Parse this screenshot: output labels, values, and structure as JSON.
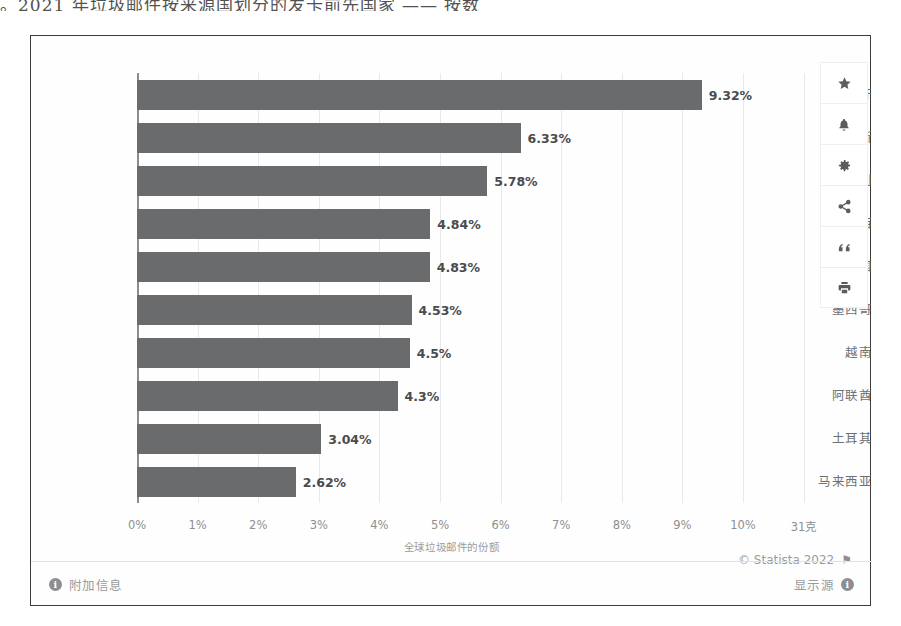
{
  "scan_text": "。2021 年垃圾邮件按来源国划分的发卡前先国家 —— 按数",
  "chart_data": {
    "type": "bar",
    "orientation": "horizontal",
    "title": "",
    "xlabel": "全球垃圾邮件的份额",
    "ylabel": "",
    "grid": true,
    "legend": false,
    "xlim": [
      0,
      10.5
    ],
    "categories": [
      "西班牙",
      "俄罗斯",
      "意大利",
      "巴西",
      "德国",
      "墨西哥",
      "越南",
      "阿联酋",
      "土耳其",
      "马来西亚"
    ],
    "values": [
      9.32,
      6.33,
      5.78,
      4.84,
      4.83,
      4.53,
      4.5,
      4.3,
      3.04,
      2.62
    ],
    "value_labels": [
      "9.32%",
      "6.33%",
      "5.78%",
      "4.84%",
      "4.83%",
      "4.53%",
      "4.5%",
      "4.3%",
      "3.04%",
      "2.62%"
    ],
    "xticks": [
      0,
      1,
      2,
      3,
      4,
      5,
      6,
      7,
      8,
      9,
      10,
      11
    ],
    "xtick_labels": [
      "0%",
      "1%",
      "2%",
      "3%",
      "4%",
      "5%",
      "6%",
      "7%",
      "8%",
      "9%",
      "10%",
      "31克"
    ],
    "bar_color": "#6a6b6d",
    "grid_color": "#e9e9ea"
  },
  "copyright": {
    "text": "© Statista 2022",
    "flag_icon": "flag-icon"
  },
  "footer": {
    "additional_info_label": "附加信息",
    "additional_info_icon": "info-icon",
    "show_source_label": "显示源",
    "show_source_icon": "info-icon"
  },
  "toolbar": {
    "items": [
      {
        "name": "favorite-star",
        "icon": "star-icon"
      },
      {
        "name": "notifications",
        "icon": "bell-icon"
      },
      {
        "name": "settings",
        "icon": "gear-icon"
      },
      {
        "name": "share",
        "icon": "share-icon"
      },
      {
        "name": "citation",
        "icon": "quote-icon"
      },
      {
        "name": "print",
        "icon": "printer-icon"
      }
    ]
  }
}
